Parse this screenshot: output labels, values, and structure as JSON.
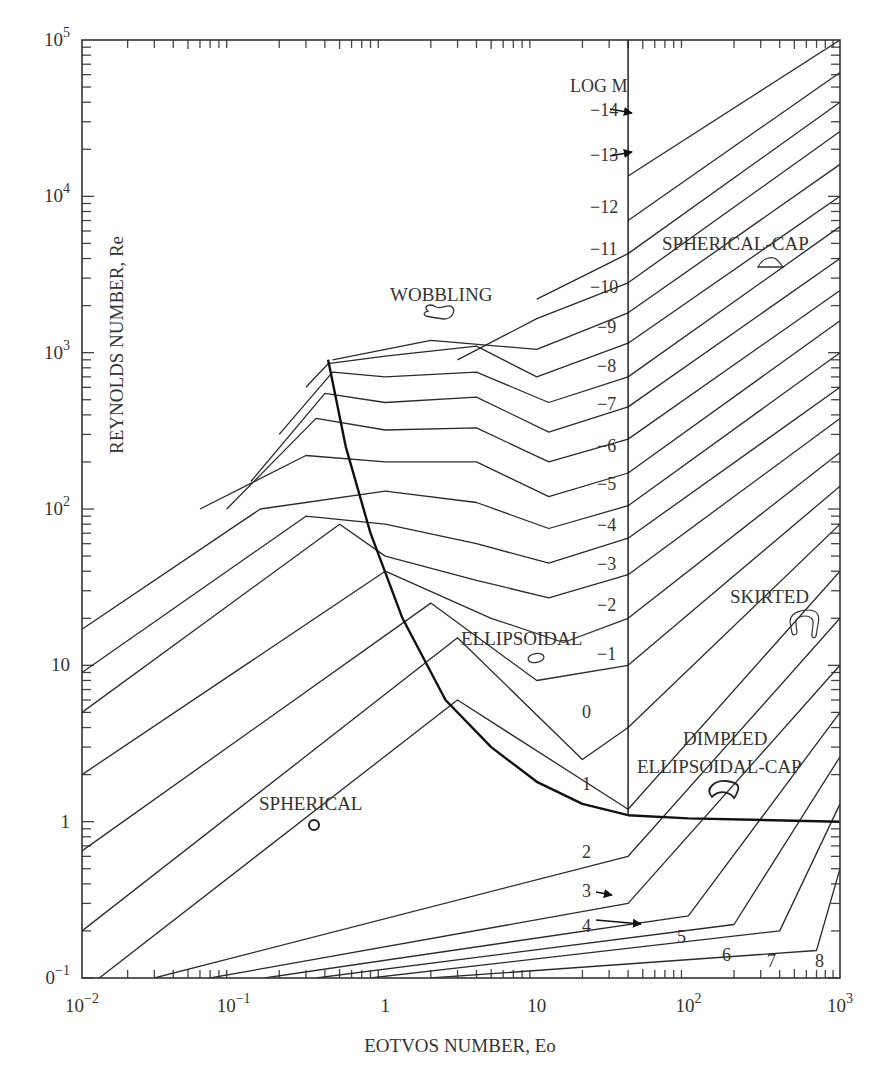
{
  "chart_data": {
    "type": "line",
    "title": "",
    "xlabel": "EOTVOS NUMBER, Eo",
    "ylabel": "REYNOLDS NUMBER, Re",
    "xscale": "log",
    "yscale": "log",
    "xlim": [
      0.01,
      1000
    ],
    "ylim": [
      0.1,
      100000
    ],
    "grid": false,
    "x_ticks": [
      {
        "value": 0.01,
        "label": "10",
        "sup": "−2"
      },
      {
        "value": 0.1,
        "label": "10",
        "sup": "−1"
      },
      {
        "value": 1,
        "label": "1",
        "sup": ""
      },
      {
        "value": 10,
        "label": "10",
        "sup": ""
      },
      {
        "value": 100,
        "label": "10",
        "sup": "2"
      },
      {
        "value": 1000,
        "label": "10",
        "sup": "3"
      }
    ],
    "y_ticks": [
      {
        "value": 100000,
        "label": "10",
        "sup": "5"
      },
      {
        "value": 10000,
        "label": "10",
        "sup": "4"
      },
      {
        "value": 1000,
        "label": "10",
        "sup": "3"
      },
      {
        "value": 100,
        "label": "10",
        "sup": "2"
      },
      {
        "value": 10,
        "label": "10",
        "sup": ""
      },
      {
        "value": 1,
        "label": "1",
        "sup": ""
      },
      {
        "value": 0.1,
        "label": "0",
        "sup": "−1"
      }
    ],
    "parameter_title": "LOG M",
    "series": [
      {
        "name": "log M = -14",
        "label": "−14",
        "points": [
          [
            40,
            13500
          ],
          [
            1000,
            100000
          ]
        ]
      },
      {
        "name": "log M = -13",
        "label": "−13",
        "points": [
          [
            40,
            7000
          ],
          [
            1000,
            62000
          ]
        ]
      },
      {
        "name": "log M = -12",
        "label": "−12",
        "points": [
          [
            10,
            2200
          ],
          [
            40,
            4300
          ],
          [
            1000,
            40000
          ]
        ]
      },
      {
        "name": "log M = -11",
        "label": "−11",
        "points": [
          [
            3,
            900
          ],
          [
            10,
            1650
          ],
          [
            40,
            2800
          ],
          [
            1000,
            26000
          ]
        ]
      },
      {
        "name": "log M = -10",
        "label": "−10",
        "points": [
          [
            0.45,
            900
          ],
          [
            2,
            1200
          ],
          [
            10,
            1050
          ],
          [
            40,
            1800
          ],
          [
            1000,
            16000
          ]
        ]
      },
      {
        "name": "log M = -9",
        "label": "−9",
        "points": [
          [
            0.3,
            600
          ],
          [
            0.42,
            850
          ],
          [
            1,
            950
          ],
          [
            4,
            1100
          ],
          [
            10,
            700
          ],
          [
            40,
            1150
          ],
          [
            1000,
            10000
          ]
        ]
      },
      {
        "name": "log M = -8",
        "label": "−8",
        "points": [
          [
            0.2,
            300
          ],
          [
            0.45,
            750
          ],
          [
            1,
            700
          ],
          [
            4,
            750
          ],
          [
            12,
            480
          ],
          [
            40,
            700
          ],
          [
            1000,
            6400
          ]
        ]
      },
      {
        "name": "log M = -7",
        "label": "−7",
        "points": [
          [
            0.13,
            150
          ],
          [
            0.4,
            550
          ],
          [
            1,
            480
          ],
          [
            4,
            520
          ],
          [
            12,
            310
          ],
          [
            40,
            450
          ],
          [
            1000,
            4000
          ]
        ]
      },
      {
        "name": "log M = -6",
        "label": "−6",
        "points": [
          [
            0.09,
            100
          ],
          [
            0.35,
            380
          ],
          [
            1,
            320
          ],
          [
            4,
            330
          ],
          [
            12,
            200
          ],
          [
            40,
            280
          ],
          [
            1000,
            2500
          ]
        ]
      },
      {
        "name": "log M = -5",
        "label": "−5",
        "points": [
          [
            0.06,
            100
          ],
          [
            0.3,
            220
          ],
          [
            1,
            200
          ],
          [
            4,
            200
          ],
          [
            12,
            120
          ],
          [
            40,
            170
          ],
          [
            1000,
            1600
          ]
        ]
      },
      {
        "name": "log M = -4",
        "label": "−4",
        "points": [
          [
            0.01,
            17
          ],
          [
            0.15,
            100
          ],
          [
            1,
            130
          ],
          [
            4,
            110
          ],
          [
            12,
            75
          ],
          [
            40,
            105
          ],
          [
            1000,
            1000
          ]
        ]
      },
      {
        "name": "log M = -3",
        "label": "−3",
        "points": [
          [
            0.01,
            9
          ],
          [
            0.3,
            90
          ],
          [
            1,
            80
          ],
          [
            4,
            60
          ],
          [
            12,
            45
          ],
          [
            40,
            65
          ],
          [
            1000,
            600
          ]
        ]
      },
      {
        "name": "log M = -2",
        "label": "−2",
        "points": [
          [
            0.01,
            5
          ],
          [
            0.5,
            80
          ],
          [
            1,
            50
          ],
          [
            4,
            35
          ],
          [
            12,
            27
          ],
          [
            40,
            38
          ],
          [
            1000,
            380
          ]
        ]
      },
      {
        "name": "log M = -1",
        "label": "−1",
        "points": [
          [
            0.01,
            2
          ],
          [
            1,
            40
          ],
          [
            5,
            20
          ],
          [
            15,
            14
          ],
          [
            40,
            20
          ],
          [
            1000,
            230
          ]
        ]
      },
      {
        "name": "log M = 0",
        "label": "0",
        "points": [
          [
            0.01,
            0.65
          ],
          [
            2,
            25
          ],
          [
            10,
            8
          ],
          [
            40,
            10
          ],
          [
            1000,
            140
          ]
        ]
      },
      {
        "name": "log M = 1",
        "label": "1",
        "points": [
          [
            0.01,
            0.2
          ],
          [
            3,
            15
          ],
          [
            20,
            2.5
          ],
          [
            40,
            4
          ],
          [
            1000,
            80
          ]
        ]
      },
      {
        "name": "log M = 2",
        "label": "2",
        "points": [
          [
            0.013,
            0.1
          ],
          [
            3,
            6
          ],
          [
            40,
            1.2
          ],
          [
            1000,
            40
          ]
        ]
      },
      {
        "name": "log M = 3",
        "label": "3",
        "points": [
          [
            0.03,
            0.1
          ],
          [
            40,
            0.6
          ],
          [
            1000,
            20
          ]
        ]
      },
      {
        "name": "log M = 4",
        "label": "4",
        "points": [
          [
            0.07,
            0.1
          ],
          [
            40,
            0.3
          ],
          [
            1000,
            10
          ]
        ]
      },
      {
        "name": "log M = 5",
        "label": "5",
        "points": [
          [
            0.16,
            0.1
          ],
          [
            100,
            0.25
          ],
          [
            1000,
            5
          ]
        ]
      },
      {
        "name": "log M = 6",
        "label": "6",
        "points": [
          [
            0.35,
            0.1
          ],
          [
            200,
            0.22
          ],
          [
            1000,
            2.6
          ]
        ]
      },
      {
        "name": "log M = 7",
        "label": "7",
        "points": [
          [
            0.8,
            0.1
          ],
          [
            400,
            0.2
          ],
          [
            1000,
            1.3
          ]
        ]
      },
      {
        "name": "log M = 8",
        "label": "8",
        "points": [
          [
            2,
            0.1
          ],
          [
            700,
            0.15
          ],
          [
            1000,
            0.5
          ]
        ]
      }
    ],
    "boundaries": [
      {
        "name": "spherical-boundary",
        "points": [
          [
            0.42,
            900
          ],
          [
            0.55,
            250
          ],
          [
            0.8,
            70
          ],
          [
            1.3,
            20
          ],
          [
            2.5,
            6
          ],
          [
            5,
            3
          ],
          [
            10,
            1.8
          ],
          [
            20,
            1.3
          ],
          [
            40,
            1.1
          ],
          [
            100,
            1.05
          ],
          [
            1000,
            1.0
          ]
        ]
      },
      {
        "name": "wobbling-boundary",
        "points": [
          [
            40,
            1.1
          ],
          [
            40,
            100000
          ]
        ]
      }
    ],
    "regions": [
      {
        "name": "SPHERICAL",
        "eo": 0.39,
        "re": 1.0
      },
      {
        "name": "ELLIPSOIDAL",
        "eo": 10,
        "re": 11
      },
      {
        "name": "WOBBLING",
        "eo": 2.5,
        "re": 1250
      },
      {
        "name": "SPHERICAL-CAP",
        "eo": 300,
        "re": 4200
      },
      {
        "name": "SKIRTED",
        "eo": 500,
        "re": 20
      },
      {
        "name": "DIMPLED ELLIPSOIDAL-CAP",
        "eo": 220,
        "re": 1.9
      }
    ]
  },
  "labels": {
    "xlabel": "EOTVOS NUMBER, Eo",
    "ylabel": "REYNOLDS NUMBER, Re",
    "log_m": "LOG M",
    "spherical": "SPHERICAL",
    "ellipsoidal": "ELLIPSOIDAL",
    "wobbling": "WOBBLING",
    "spherical_cap": "SPHERICAL-CAP",
    "skirted": "SKIRTED",
    "dimpled_1": "DIMPLED",
    "dimpled_2": "ELLIPSOIDAL-CAP"
  },
  "morton_labels": [
    {
      "text": "−14",
      "x": 590,
      "y": 116
    },
    {
      "text": "−13",
      "x": 590,
      "y": 161
    },
    {
      "text": "−12",
      "x": 590,
      "y": 213
    },
    {
      "text": "−11",
      "x": 590,
      "y": 255
    },
    {
      "text": "−10",
      "x": 590,
      "y": 293
    },
    {
      "text": "−9",
      "x": 597,
      "y": 333
    },
    {
      "text": "−8",
      "x": 597,
      "y": 372
    },
    {
      "text": "−7",
      "x": 597,
      "y": 410
    },
    {
      "text": "−6",
      "x": 597,
      "y": 452
    },
    {
      "text": "−5",
      "x": 597,
      "y": 490
    },
    {
      "text": "−4",
      "x": 597,
      "y": 531
    },
    {
      "text": "−3",
      "x": 597,
      "y": 570
    },
    {
      "text": "−2",
      "x": 597,
      "y": 611
    },
    {
      "text": "−1",
      "x": 597,
      "y": 660
    },
    {
      "text": "0",
      "x": 582,
      "y": 718
    },
    {
      "text": "1",
      "x": 582,
      "y": 790
    },
    {
      "text": "2",
      "x": 582,
      "y": 858
    },
    {
      "text": "3",
      "x": 582,
      "y": 897
    },
    {
      "text": "4",
      "x": 582,
      "y": 932
    },
    {
      "text": "5",
      "x": 677,
      "y": 943
    },
    {
      "text": "6",
      "x": 722,
      "y": 961
    },
    {
      "text": "7",
      "x": 767,
      "y": 967
    },
    {
      "text": "8",
      "x": 815,
      "y": 967
    }
  ],
  "arrows": [
    {
      "from": [
        610,
        109
      ],
      "to": [
        632,
        113
      ]
    },
    {
      "from": [
        610,
        156
      ],
      "to": [
        632,
        152
      ]
    },
    {
      "from": [
        596,
        892
      ],
      "to": [
        612,
        895
      ]
    },
    {
      "from": [
        596,
        920
      ],
      "to": [
        641,
        924
      ]
    }
  ]
}
